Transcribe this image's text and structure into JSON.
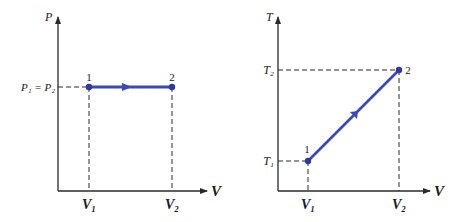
{
  "colors": {
    "process_line": "#3a48b8",
    "axis": "#2a2a2a",
    "background": "#ffffff"
  },
  "left_diagram": {
    "y_axis_label": "P",
    "x_axis_label": "V",
    "y_tick_label": "P₁ = P₂",
    "x_tick_labels": [
      "V₁",
      "V₂"
    ],
    "point_labels": [
      "1",
      "2"
    ],
    "process": "isobaric (constant pressure) expansion from state 1 to state 2"
  },
  "right_diagram": {
    "y_axis_label": "T",
    "x_axis_label": "V",
    "y_tick_labels": [
      "T₁",
      "T₂"
    ],
    "x_tick_labels": [
      "V₁",
      "V₂"
    ],
    "point_labels": [
      "1",
      "2"
    ],
    "process": "temperature rises linearly with volume from state 1 to state 2"
  }
}
